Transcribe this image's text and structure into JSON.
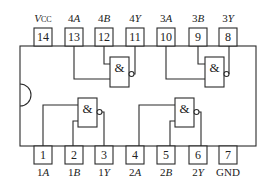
{
  "diagram": {
    "type": "IC pinout",
    "gate_symbol": "&",
    "gate_count": 4,
    "top_pins": [
      {
        "number": "14",
        "label": "VCC",
        "label_main": "V",
        "label_sub": "CC",
        "x": 43
      },
      {
        "number": "13",
        "label": "4A",
        "label_main": "4",
        "label_sub": "A",
        "x": 74
      },
      {
        "number": "12",
        "label": "4B",
        "label_main": "4",
        "label_sub": "B",
        "x": 104
      },
      {
        "number": "11",
        "label": "4Y",
        "label_main": "4",
        "label_sub": "Y",
        "x": 135
      },
      {
        "number": "10",
        "label": "3A",
        "label_main": "3",
        "label_sub": "A",
        "x": 166
      },
      {
        "number": "9",
        "label": "3B",
        "label_main": "3",
        "label_sub": "B",
        "x": 198
      },
      {
        "number": "8",
        "label": "3Y",
        "label_main": "3",
        "label_sub": "Y",
        "x": 228
      }
    ],
    "bottom_pins": [
      {
        "number": "1",
        "label": "1A",
        "label_main": "1",
        "label_sub": "A",
        "x": 43
      },
      {
        "number": "2",
        "label": "1B",
        "label_main": "1",
        "label_sub": "B",
        "x": 74
      },
      {
        "number": "3",
        "label": "1Y",
        "label_main": "1",
        "label_sub": "Y",
        "x": 104
      },
      {
        "number": "4",
        "label": "2A",
        "label_main": "2",
        "label_sub": "A",
        "x": 135
      },
      {
        "number": "5",
        "label": "2B",
        "label_main": "2",
        "label_sub": "B",
        "x": 166
      },
      {
        "number": "6",
        "label": "2Y",
        "label_main": "2",
        "label_sub": "Y",
        "x": 198
      },
      {
        "number": "7",
        "label": "GND",
        "label_main": "GND",
        "label_sub": "",
        "x": 228
      }
    ],
    "gates": [
      {
        "name": "gate-1",
        "symbol": "&",
        "inputs": [
          "1A",
          "1B"
        ],
        "output": "1Y"
      },
      {
        "name": "gate-2",
        "symbol": "&",
        "inputs": [
          "2A",
          "2B"
        ],
        "output": "2Y"
      },
      {
        "name": "gate-3",
        "symbol": "&",
        "inputs": [
          "3A",
          "3B"
        ],
        "output": "3Y"
      },
      {
        "name": "gate-4",
        "symbol": "&",
        "inputs": [
          "4A",
          "4B"
        ],
        "output": "4Y"
      }
    ]
  }
}
